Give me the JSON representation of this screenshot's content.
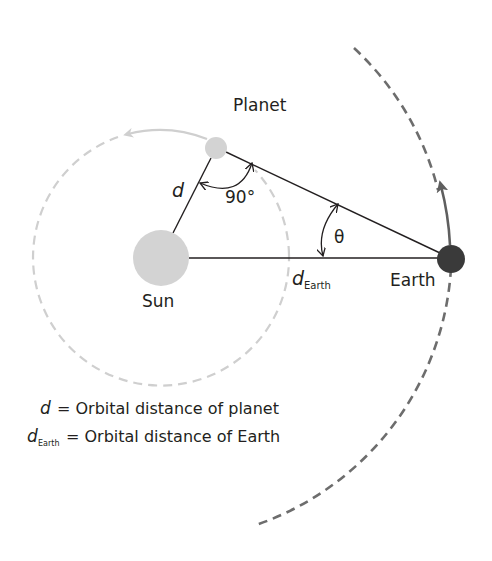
{
  "diagram": {
    "labels": {
      "planet": "Planet",
      "sun": "Sun",
      "earth": "Earth",
      "d": "d",
      "d_earth_main": "d",
      "d_earth_sub": "Earth",
      "right_angle": "90°",
      "theta": "θ"
    },
    "legend": [
      {
        "symbol": "d",
        "subscript": "",
        "text": "= Orbital distance of planet"
      },
      {
        "symbol": "d",
        "subscript": "Earth",
        "text": "= Orbital distance of Earth"
      }
    ],
    "colors": {
      "sun": "#d3d3d3",
      "planet": "#d3d3d3",
      "earth": "#3a3a3a",
      "inner_orbit": "#cfcfcf",
      "outer_orbit": "#6d6d6d",
      "line": "#231f20"
    }
  }
}
